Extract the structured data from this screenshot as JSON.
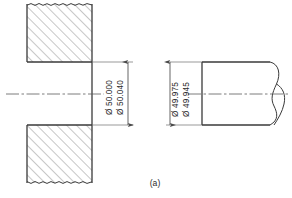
{
  "figure": {
    "caption": "(a)",
    "colors": {
      "outline": "#3a3a3a",
      "hatch": "#6b6b6b",
      "centerline": "#5a5a5a",
      "dimension": "#4a4a4a",
      "text": "#2b2b2b",
      "background": "#ffffff"
    },
    "views": {
      "hole": {
        "name": "hole-section-view",
        "dimensions": {
          "upper_label": "Ø 50.040",
          "lower_label": "Ø 50.000"
        },
        "icons": {
          "hatch": "section-hatch-icon",
          "break_edge": "ragged-break-icon",
          "centerline": "centerline-icon",
          "arrow_up": "dimension-arrow-up-icon",
          "arrow_down": "dimension-arrow-down-icon"
        }
      },
      "shaft": {
        "name": "shaft-view",
        "dimensions": {
          "upper_label": "Ø 49.975",
          "lower_label": "Ø 49.945"
        },
        "icons": {
          "break_symbol": "figure-eight-break-icon",
          "centerline": "centerline-icon",
          "arrow_up": "dimension-arrow-up-icon",
          "arrow_down": "dimension-arrow-down-icon"
        }
      }
    }
  }
}
